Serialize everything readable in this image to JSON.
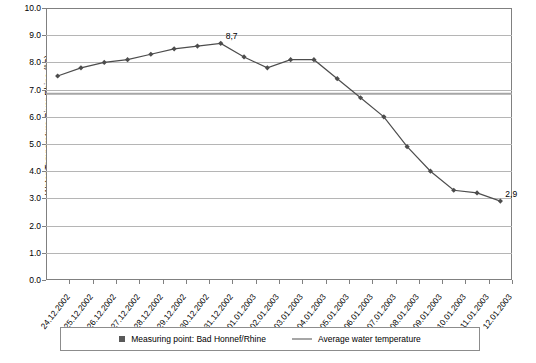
{
  "chart_data": {
    "type": "line",
    "title": "",
    "xlabel": "",
    "ylabel": "Water Temperature River Rhine (°C)",
    "ylim": [
      0.0,
      10.0
    ],
    "grid": true,
    "legend_position": "bottom",
    "categories": [
      "24.12.2002",
      "25.12.2002",
      "26.12.2002",
      "27.12.2002",
      "28.12.2002",
      "29.12.2002",
      "30.12.2002",
      "31.12.2002",
      "01.01.2003",
      "02.01.2003",
      "03.01.2003",
      "04.01.2003",
      "05.01.2003",
      "06.01.2003",
      "07.01.2003",
      "08.01.2003",
      "09.01.2003",
      "10.01.2003",
      "11.01.2003",
      "12.01.2003"
    ],
    "ytick_labels": [
      "0.0",
      "1.0",
      "2.0",
      "3.0",
      "4.0",
      "5.0",
      "6.0",
      "7.0",
      "8.0",
      "9.0",
      "10.0"
    ],
    "ytick_values": [
      0,
      1,
      2,
      3,
      4,
      5,
      6,
      7,
      8,
      9,
      10
    ],
    "series": [
      {
        "name": "Measuring point: Bad Honnef/Rhine",
        "marker": "diamond",
        "color": "#4d4d4d",
        "values": [
          7.5,
          7.8,
          8.0,
          8.1,
          8.3,
          8.5,
          8.6,
          8.7,
          8.2,
          7.8,
          8.1,
          8.1,
          7.4,
          6.7,
          6.0,
          4.9,
          4.0,
          3.3,
          3.2,
          2.9
        ]
      },
      {
        "name": "Average water temperature",
        "marker": "line",
        "color": "#a6a6a6",
        "constant_value": 6.85,
        "values": [
          6.85,
          6.85,
          6.85,
          6.85,
          6.85,
          6.85,
          6.85,
          6.85,
          6.85,
          6.85,
          6.85,
          6.85,
          6.85,
          6.85,
          6.85,
          6.85,
          6.85,
          6.85,
          6.85,
          6.85
        ]
      }
    ],
    "annotations": [
      {
        "label": "8,7",
        "x_index": 7,
        "y": 8.7
      },
      {
        "label": "2,9",
        "x_index": 19,
        "y": 2.9
      }
    ]
  },
  "legend": {
    "entries": [
      {
        "label": "Measuring point: Bad Honnef/Rhine",
        "marker": "square"
      },
      {
        "label": "Average water temperature",
        "marker": "line"
      }
    ]
  }
}
